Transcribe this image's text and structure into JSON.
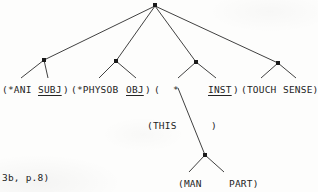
{
  "figure": {
    "type": "dependency-parse-tree",
    "caption": "3b, p.8)",
    "background_color": "#fdfdfc",
    "ink_color": "#242424"
  },
  "nodes": {
    "root": {
      "name": "root-node",
      "x": 155,
      "y": 5
    },
    "ani": {
      "name": "ani-node",
      "x": 44,
      "y": 60
    },
    "physob": {
      "name": "physob-node",
      "x": 116,
      "y": 61
    },
    "inst": {
      "name": "inst-node",
      "x": 196,
      "y": 62
    },
    "touch": {
      "name": "touch-node",
      "x": 278,
      "y": 63
    },
    "man": {
      "name": "man-node",
      "x": 205,
      "y": 155
    }
  },
  "labels": {
    "row_main": [
      {
        "id": "ani",
        "text": "(*ANI",
        "x": 2,
        "y": 84,
        "underline": false
      },
      {
        "id": "subj",
        "text": "SUBJ",
        "x": 38,
        "y": 84,
        "underline": true
      },
      {
        "id": "subj_p",
        "text": ")",
        "x": 63,
        "y": 84,
        "underline": false
      },
      {
        "id": "physob",
        "text": "(*PHYSOB",
        "x": 71,
        "y": 84,
        "underline": false
      },
      {
        "id": "obj",
        "text": "OBJ",
        "x": 126,
        "y": 84,
        "underline": true
      },
      {
        "id": "obj_p",
        "text": ")",
        "x": 145,
        "y": 84,
        "underline": false
      },
      {
        "id": "open1",
        "text": "(",
        "x": 154,
        "y": 84,
        "underline": false
      },
      {
        "id": "star",
        "text": "*",
        "x": 173,
        "y": 84,
        "underline": false
      },
      {
        "id": "inst",
        "text": "INST",
        "x": 208,
        "y": 84,
        "underline": true
      },
      {
        "id": "inst_p",
        "text": ")",
        "x": 233,
        "y": 84,
        "underline": false
      },
      {
        "id": "touch",
        "text": "(TOUCH",
        "x": 241,
        "y": 84,
        "underline": false
      },
      {
        "id": "sense",
        "text": "SENSE)",
        "x": 283,
        "y": 84,
        "underline": false
      }
    ],
    "row_this": [
      {
        "id": "this",
        "text": "(THIS",
        "x": 147,
        "y": 120,
        "underline": false
      },
      {
        "id": "this_clo",
        "text": ")",
        "x": 211,
        "y": 120,
        "underline": false
      }
    ],
    "row_bottom": [
      {
        "id": "man",
        "text": "(MAN",
        "x": 178,
        "y": 178,
        "underline": false
      },
      {
        "id": "part",
        "text": "PART)",
        "x": 229,
        "y": 178,
        "underline": false
      }
    ]
  },
  "edges": [
    {
      "from": "root",
      "to": "ani"
    },
    {
      "from": "root",
      "to": "physob"
    },
    {
      "from": "root",
      "to": "inst"
    },
    {
      "from": "root",
      "to": "touch"
    },
    {
      "from": "ani",
      "to": "ani-left-leaf"
    },
    {
      "from": "ani",
      "to": "subj-leaf"
    },
    {
      "from": "physob",
      "to": "physob-left-leaf"
    },
    {
      "from": "physob",
      "to": "obj-leaf"
    },
    {
      "from": "inst",
      "to": "star-leaf"
    },
    {
      "from": "inst",
      "to": "inst-leaf"
    },
    {
      "from": "touch",
      "to": "touch-leaf"
    },
    {
      "from": "touch",
      "to": "sense-leaf"
    },
    {
      "from": "star-leaf",
      "to": "man"
    },
    {
      "from": "man",
      "to": "man-leaf"
    },
    {
      "from": "man",
      "to": "part-leaf"
    }
  ]
}
